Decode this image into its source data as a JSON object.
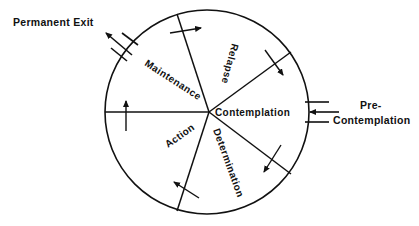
{
  "diagram": {
    "type": "stages-of-change-wheel",
    "stroke_color": "#111111",
    "background": "#ffffff",
    "stages": [
      {
        "id": "contemplation",
        "label": "Contemplation"
      },
      {
        "id": "determination",
        "label": "Determination"
      },
      {
        "id": "action",
        "label": "Action"
      },
      {
        "id": "maintenance",
        "label": "Maintenance"
      },
      {
        "id": "relapse",
        "label": "Relapse"
      }
    ],
    "entry": {
      "label_line1": "Pre-",
      "label_line2": "Contemplation"
    },
    "exit": {
      "label": "Permanent Exit"
    },
    "flow_direction": "clockwise"
  }
}
